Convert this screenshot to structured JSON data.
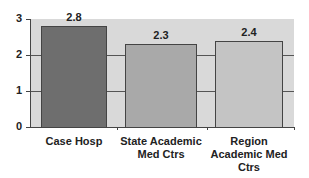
{
  "chart_data": {
    "type": "bar",
    "title": "",
    "xlabel": "",
    "ylabel": "",
    "categories": [
      "Case Hosp",
      "State Academic Med Ctrs",
      "Region Academic Med Ctrs"
    ],
    "category_lines": [
      [
        "Case Hosp"
      ],
      [
        "State Academic",
        "Med Ctrs"
      ],
      [
        "Region",
        "Academic Med",
        "Ctrs"
      ]
    ],
    "values": [
      2.8,
      2.3,
      2.4
    ],
    "value_labels": [
      "2.8",
      "2.3",
      "2.4"
    ],
    "ylim": [
      0,
      3
    ],
    "yticks": [
      0,
      1,
      2,
      3
    ],
    "ytick_labels": [
      "0",
      "1",
      "2",
      "3"
    ],
    "grid": true,
    "legend": null,
    "colors": {
      "plot_bg": "#d9d9d9",
      "bars": [
        "#6e6e6e",
        "#a9a9a9",
        "#c4c4c4"
      ]
    }
  }
}
